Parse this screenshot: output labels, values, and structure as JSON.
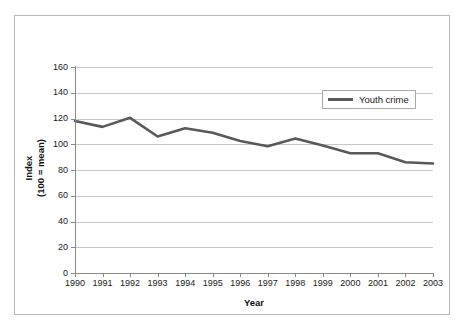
{
  "chart_data": {
    "type": "line",
    "title": "",
    "xlabel": "Year",
    "ylabel_line1": "Index",
    "ylabel_line2": "(100 = mean)",
    "categories": [
      "1990",
      "1991",
      "1992",
      "1993",
      "1994",
      "1995",
      "1996",
      "1997",
      "1998",
      "1999",
      "2000",
      "2001",
      "2002",
      "2003"
    ],
    "series": [
      {
        "name": "Youth crime",
        "color": "#595959",
        "values": [
          118,
          113.5,
          120.5,
          106,
          112.5,
          109,
          102.5,
          98.5,
          104.5,
          99,
          93,
          93,
          86,
          85
        ]
      }
    ],
    "ylim": [
      0,
      160
    ],
    "yticks": [
      0,
      20,
      40,
      60,
      80,
      100,
      120,
      140,
      160
    ],
    "ytick_labels": [
      "0",
      "20",
      "40",
      "60",
      "80",
      "100",
      "120",
      "140",
      "160"
    ],
    "grid": true,
    "legend_position": "upper-right",
    "legend_entries": [
      "Youth crime"
    ]
  },
  "colors": {
    "series": "#595959",
    "gridline": "#c8c8c8",
    "axis": "#8a8a8a",
    "frame": "#b9b9b9",
    "text": "#1a1a1a",
    "background": "#ffffff"
  }
}
